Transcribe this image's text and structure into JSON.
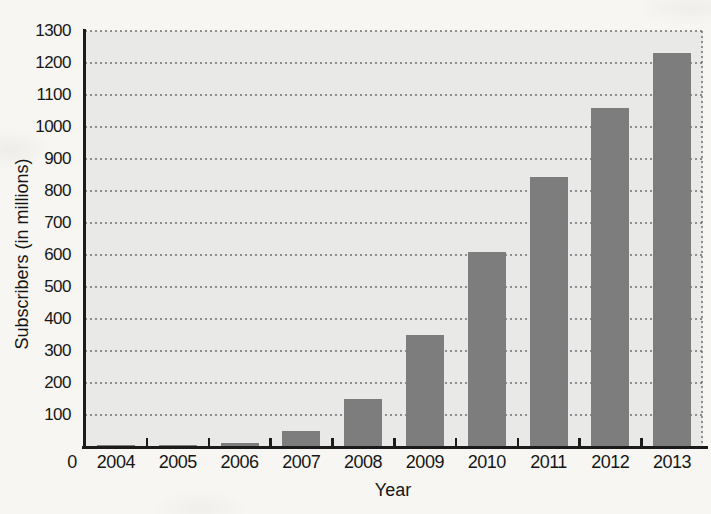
{
  "figure": {
    "background_color": "#f7f6f2",
    "plot_background_color": "#e9e9e8",
    "bar_color": "#7d7d7d",
    "axis_color": "#1b1b1b",
    "gridline_color": "#6f6f6f"
  },
  "chart_data": {
    "type": "bar",
    "title": "",
    "xlabel": "Year",
    "ylabel": "Subscribers (in millions)",
    "categories": [
      "2004",
      "2005",
      "2006",
      "2007",
      "2008",
      "2009",
      "2010",
      "2011",
      "2012",
      "2013"
    ],
    "values": [
      2,
      6,
      12,
      50,
      150,
      350,
      610,
      845,
      1060,
      1230
    ],
    "ylim": [
      0,
      1300
    ],
    "ytick_interval": 100,
    "yticks": [
      0,
      100,
      200,
      300,
      400,
      500,
      600,
      700,
      800,
      900,
      1000,
      1100,
      1200,
      1300
    ],
    "origin_label": "0",
    "grid": "horizontal-dotted",
    "legend": "none"
  }
}
